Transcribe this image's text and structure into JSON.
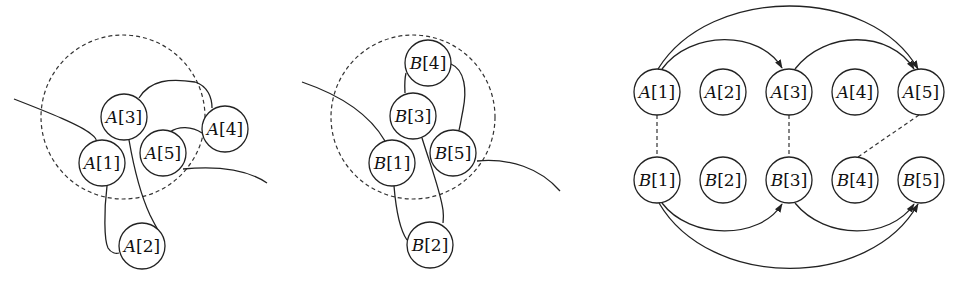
{
  "panels": [
    {
      "id": "panel-a",
      "boundary": {
        "cx": 123,
        "cy": 117,
        "r": 82
      },
      "nodes": [
        {
          "label": "A",
          "index": "1",
          "x": 102,
          "y": 163
        },
        {
          "label": "A",
          "index": "2",
          "x": 142,
          "y": 246
        },
        {
          "label": "A",
          "index": "3",
          "x": 124,
          "y": 117
        },
        {
          "label": "A",
          "index": "4",
          "x": 225,
          "y": 129
        },
        {
          "label": "A",
          "index": "5",
          "x": 163,
          "y": 153
        }
      ]
    },
    {
      "id": "panel-b",
      "boundary": {
        "cx": 413,
        "cy": 117,
        "r": 82
      },
      "nodes": [
        {
          "label": "B",
          "index": "1",
          "x": 392,
          "y": 163
        },
        {
          "label": "B",
          "index": "2",
          "x": 430,
          "y": 245
        },
        {
          "label": "B",
          "index": "3",
          "x": 413,
          "y": 116
        },
        {
          "label": "B",
          "index": "4",
          "x": 428,
          "y": 63
        },
        {
          "label": "B",
          "index": "5",
          "x": 453,
          "y": 153
        }
      ]
    },
    {
      "id": "panel-mapping",
      "nodes_top": [
        {
          "label": "A",
          "index": "1",
          "x": 657,
          "y": 92
        },
        {
          "label": "A",
          "index": "2",
          "x": 723,
          "y": 92
        },
        {
          "label": "A",
          "index": "3",
          "x": 789,
          "y": 92
        },
        {
          "label": "A",
          "index": "4",
          "x": 855,
          "y": 92
        },
        {
          "label": "A",
          "index": "5",
          "x": 921,
          "y": 92
        }
      ],
      "nodes_bottom": [
        {
          "label": "B",
          "index": "1",
          "x": 657,
          "y": 180
        },
        {
          "label": "B",
          "index": "2",
          "x": 723,
          "y": 180
        },
        {
          "label": "B",
          "index": "3",
          "x": 789,
          "y": 180
        },
        {
          "label": "B",
          "index": "4",
          "x": 855,
          "y": 180
        },
        {
          "label": "B",
          "index": "5",
          "x": 921,
          "y": 180
        }
      ],
      "arrows_top": [
        {
          "from": "A[1]",
          "to": "A[3]"
        },
        {
          "from": "A[1]",
          "to": "A[5]"
        },
        {
          "from": "A[3]",
          "to": "A[5]"
        }
      ],
      "arrows_bottom": [
        {
          "from": "B[1]",
          "to": "B[3]"
        },
        {
          "from": "B[1]",
          "to": "B[5]"
        },
        {
          "from": "B[3]",
          "to": "B[5]"
        }
      ],
      "correspondences": [
        {
          "from": "A[1]",
          "to": "B[1]"
        },
        {
          "from": "A[3]",
          "to": "B[3]"
        },
        {
          "from": "A[5]",
          "to": "B[4]"
        }
      ]
    }
  ]
}
